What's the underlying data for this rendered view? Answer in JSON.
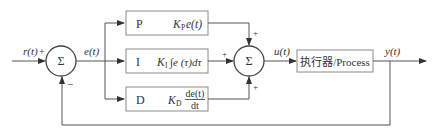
{
  "diagram": {
    "type": "PID control block diagram",
    "signals": {
      "reference": "r(t)",
      "reference_sign": "+",
      "error": "e(t)",
      "control": "u(t)",
      "output": "y(t)",
      "feedback_sign": "−"
    },
    "summing_junction_left": {
      "symbol": "Σ",
      "signs": [
        "+",
        "−"
      ]
    },
    "summing_junction_right": {
      "symbol": "Σ",
      "signs": [
        "+",
        "+",
        "+"
      ]
    },
    "blocks": [
      {
        "id": "P",
        "label": "P",
        "expr_coef": "K",
        "expr_sub": "P",
        "expr_rest": "e(t)"
      },
      {
        "id": "I",
        "label": "I",
        "expr_coef": "K",
        "expr_sub": "I",
        "expr_rest": "∫e (τ)dτ"
      },
      {
        "id": "D",
        "label": "D",
        "expr_coef": "K",
        "expr_sub": "D",
        "expr_num": "de(t)",
        "expr_den": "dt"
      }
    ],
    "process_block": {
      "label": "执行器/Process"
    }
  }
}
